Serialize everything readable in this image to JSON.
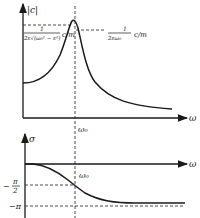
{
  "figure": {
    "top_plot": {
      "y_axis_label": "|c|",
      "x_axis_label": "ω",
      "peak_label_left": {
        "numerator": "1",
        "denominator": "2ε√(ω₀² − ε²)",
        "factor": "c/m"
      },
      "peak_label_right": {
        "numerator": "1",
        "denominator": "2εω₀",
        "factor": "c/m"
      },
      "x_tick_label": "ω₀"
    },
    "bottom_plot": {
      "y_axis_label": "σ",
      "x_axis_label": "ω",
      "x_tick_label": "ω₀",
      "y_tick_labels": [
        "−π/2",
        "−π"
      ],
      "y_tick_minus_half_pi": {
        "sign": "−",
        "numerator": "π",
        "denominator": "2"
      },
      "y_tick_minus_pi": "−π"
    }
  }
}
